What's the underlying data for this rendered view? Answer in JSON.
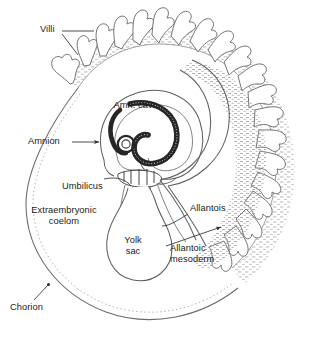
{
  "figure": {
    "type": "anatomical-diagram",
    "background_color": "#ffffff",
    "line_color": "#5a5a5a",
    "text_color": "#1a1a1a",
    "embryo_fill": "#2b2b2b",
    "stipple_color": "#9a9a9a"
  },
  "labels": {
    "villi": "Villi",
    "amn_cav": "Amn. cav.",
    "amnion": "Amnion",
    "amnion_arrow": "→",
    "umbilicus": "Umbilicus",
    "extraembryonic_coelom_line1": "Extraembryonic",
    "extraembryonic_coelom_line2": "coelom",
    "yolk_sac_line1": "Yolk",
    "yolk_sac_line2": "sac",
    "allantois": "Allantois",
    "allantoic_mesoderm_line1": "Allantoic",
    "allantoic_mesoderm_line2": "mesoderm",
    "chorion": "Chorion"
  },
  "structures": [
    {
      "name": "villi",
      "description": "finger-like branched chorionic villi around upper and right rim"
    },
    {
      "name": "chorion",
      "description": "outer oval membrane of the conceptus"
    },
    {
      "name": "extraembryonic-coelom",
      "description": "large clear cavity between chorion and amnion"
    },
    {
      "name": "amnion",
      "description": "membrane enclosing the amniotic cavity"
    },
    {
      "name": "amniotic-cavity",
      "description": "space around the curled embryo"
    },
    {
      "name": "embryo",
      "description": "dark curled embryo at center"
    },
    {
      "name": "umbilicus",
      "description": "constricted stalk below the embryo"
    },
    {
      "name": "yolk-sac",
      "description": "pear-shaped sac hanging from umbilicus"
    },
    {
      "name": "allantois",
      "description": "diverticulum extending to the right"
    },
    {
      "name": "allantoic-mesoderm",
      "description": "stippled mesodermal layer lining chorion"
    }
  ]
}
